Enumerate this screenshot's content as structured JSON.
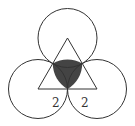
{
  "diagram": {
    "colors": {
      "stroke": "#333333",
      "shaded": "#444444",
      "background": "#ffffff"
    },
    "triangle": {
      "vertices": [
        [
          67.5,
          38
        ],
        [
          38,
          89
        ],
        [
          97,
          89
        ]
      ]
    },
    "circles": [
      {
        "name": "top",
        "cx": 67.5,
        "cy": 38,
        "r": 29.5
      },
      {
        "name": "left",
        "cx": 38,
        "cy": 89,
        "r": 29.5
      },
      {
        "name": "right",
        "cx": 97,
        "cy": 89,
        "r": 29.5
      }
    ],
    "labels": [
      {
        "text": "2",
        "x": 52,
        "y": 107
      },
      {
        "text": "2",
        "x": 81,
        "y": 107
      }
    ]
  }
}
